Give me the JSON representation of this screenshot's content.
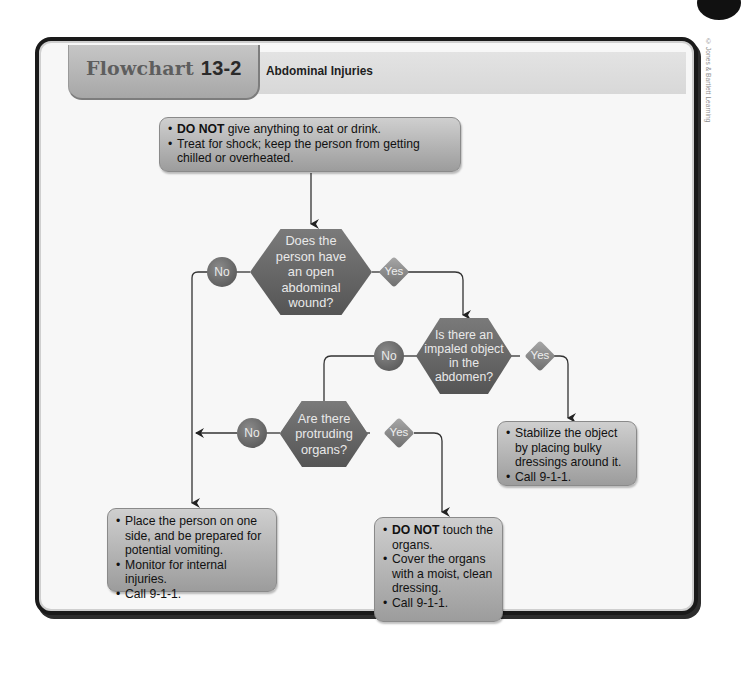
{
  "credit": "© Jones & Bartlett Learning",
  "header": {
    "flowchart_word": "Flowchart",
    "flowchart_number": "13-2",
    "title": "Abdominal Injuries"
  },
  "start_box": {
    "items": [
      {
        "bold": "DO NOT",
        "text": " give anything to eat or drink."
      },
      {
        "bold": "",
        "text": "Treat for shock; keep the person from getting chilled or overheated."
      }
    ]
  },
  "decisions": [
    {
      "id": "open-wound",
      "text": "Does the person have an open abdominal wound?",
      "no": "No",
      "yes": "Yes"
    },
    {
      "id": "impaled-object",
      "text": "Is there an impaled object in the abdomen?",
      "no": "No",
      "yes": "Yes"
    },
    {
      "id": "protruding-organs",
      "text": "Are there protruding organs?",
      "no": "No",
      "yes": "Yes"
    }
  ],
  "action_boxes": {
    "stabilize": {
      "items": [
        {
          "bold": "",
          "text": "Stabilize the object by placing bulky dressings around it."
        },
        {
          "bold": "",
          "text": "Call 9-1-1."
        }
      ]
    },
    "side_position": {
      "items": [
        {
          "bold": "",
          "text": "Place the person on one side, and be prepared for potential vomiting."
        },
        {
          "bold": "",
          "text": "Monitor for internal injuries."
        },
        {
          "bold": "",
          "text": "Call 9-1-1."
        }
      ]
    },
    "organs": {
      "items": [
        {
          "bold": "DO NOT",
          "text": " touch the organs."
        },
        {
          "bold": "",
          "text": "Cover the organs with a moist, clean dressing."
        },
        {
          "bold": "",
          "text": "Call 9-1-1."
        }
      ]
    }
  },
  "bullet": "•",
  "colors": {
    "frame": "#1a1a1a",
    "hexagon": "#666666",
    "box": "#b5b5b5",
    "line": "#333333"
  }
}
